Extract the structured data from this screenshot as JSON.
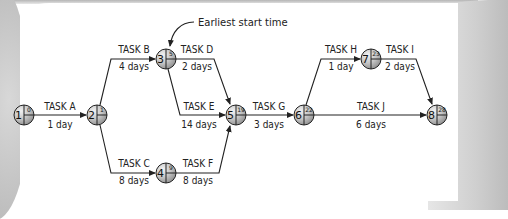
{
  "diagram": {
    "annotation": "Earliest start time",
    "nodes": [
      {
        "id": "1",
        "es": "0"
      },
      {
        "id": "2",
        "es": "1"
      },
      {
        "id": "3",
        "es": "5"
      },
      {
        "id": "4",
        "es": "9"
      },
      {
        "id": "5",
        "es": "19"
      },
      {
        "id": "6",
        "es": "22"
      },
      {
        "id": "7",
        "es": "23"
      },
      {
        "id": "8",
        "es": "28"
      }
    ],
    "tasks": [
      {
        "name": "TASK A",
        "duration": "1 day",
        "from": "1",
        "to": "2"
      },
      {
        "name": "TASK B",
        "duration": "4 days",
        "from": "2",
        "to": "3"
      },
      {
        "name": "TASK C",
        "duration": "8 days",
        "from": "2",
        "to": "4"
      },
      {
        "name": "TASK D",
        "duration": "2 days",
        "from": "3",
        "to": "5"
      },
      {
        "name": "TASK E",
        "duration": "14 days",
        "from": "3",
        "to": "5"
      },
      {
        "name": "TASK F",
        "duration": "8 days",
        "from": "4",
        "to": "5"
      },
      {
        "name": "TASK G",
        "duration": "3 days",
        "from": "5",
        "to": "6"
      },
      {
        "name": "TASK H",
        "duration": "1 day",
        "from": "6",
        "to": "7"
      },
      {
        "name": "TASK I",
        "duration": "2 days",
        "from": "7",
        "to": "8"
      },
      {
        "name": "TASK J",
        "duration": "6 days",
        "from": "6",
        "to": "8"
      }
    ]
  },
  "colors": {
    "line": "#222222",
    "node_fill": "#c8c8c8",
    "node_highlight": "#ececec"
  }
}
